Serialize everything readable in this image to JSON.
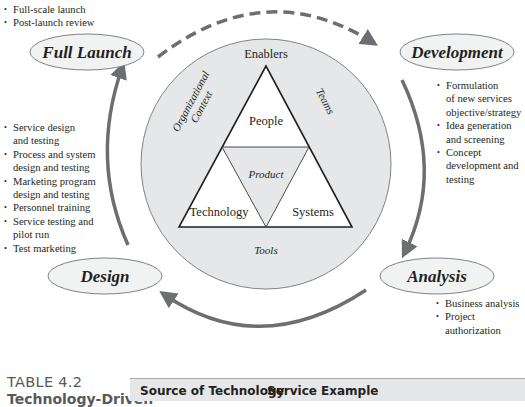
{
  "diagram": {
    "stages": {
      "full_launch": "Full Launch",
      "development": "Development",
      "analysis": "Analysis",
      "design": "Design"
    },
    "center": {
      "enablers_label": "Enablers",
      "organizational_context_line1": "Organizational",
      "organizational_context_line2": "Context",
      "teams_label": "Teams",
      "tools_label": "Tools",
      "people_label": "People",
      "product_label": "Product",
      "technology_label": "Technology",
      "systems_label": "Systems"
    },
    "bullets": {
      "full_launch": [
        "Full-scale launch",
        "Post-launch review"
      ],
      "development": [
        [
          "Formulation",
          "of new services",
          "objective/strategy"
        ],
        [
          "Idea generation",
          "and screening"
        ],
        [
          "Concept",
          "development and",
          "testing"
        ]
      ],
      "design": [
        [
          "Service design",
          "and testing"
        ],
        [
          "Process and system",
          "design and testing"
        ],
        [
          "Marketing program",
          "design and testing"
        ],
        [
          "Personnel training"
        ],
        [
          "Service testing and",
          "pilot run"
        ],
        [
          "Test marketing"
        ]
      ],
      "analysis": [
        [
          "Business analysis"
        ],
        [
          "Project",
          "authorization"
        ]
      ]
    },
    "colors": {
      "circle_fill": "#e6e7e8",
      "arrow": "#6d6e71",
      "ellipse_fill": "#f1f2f2",
      "line": "#231f20"
    }
  },
  "table": {
    "number": "TABLE 4.2",
    "title_partial": "Technology-Driven",
    "columns": [
      "Source of Technology",
      "Service Example"
    ]
  }
}
